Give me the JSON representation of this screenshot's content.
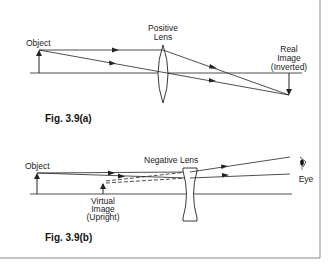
{
  "figure_a": {
    "caption": "Fig. 3.9(a)",
    "object_label": "Object",
    "lens_label_line1": "Positive",
    "lens_label_line2": "Lens",
    "image_label_line1": "Real",
    "image_label_line2": "Image",
    "image_label_line3": "(Inverted)"
  },
  "figure_b": {
    "caption": "Fig. 3.9(b)",
    "object_label": "Object",
    "lens_label": "Negative Lens",
    "image_label_line1": "Virtual",
    "image_label_line2": "Image",
    "image_label_line3": "(Upright)",
    "eye_label": "Eye"
  },
  "colors": {
    "line": "#222222",
    "border": "#888888",
    "background": "#ffffff"
  }
}
